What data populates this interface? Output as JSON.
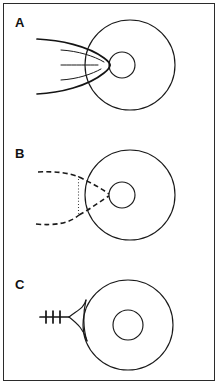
{
  "figure": {
    "width": 218,
    "height": 384,
    "background_color": "#ffffff",
    "border_color": "#2b2b2b",
    "stroke_color": "#1a1a1a"
  },
  "panels": [
    {
      "id": "A",
      "label": "A",
      "label_x": 15,
      "label_y": 27,
      "description": "Solid outer disk circle with smaller inner circle left of center; a solid tapered streamer envelope enters from the left and converges at the inner circle, with three short interior streak lines.",
      "outer_circle": {
        "cx": 130,
        "cy": 65,
        "r": 45,
        "style": "solid"
      },
      "inner_circle": {
        "cx": 122,
        "cy": 65,
        "r": 13,
        "style": "solid"
      },
      "feature": "solid-streamer-envelope",
      "streak_count": 3
    },
    {
      "id": "B",
      "label": "B",
      "label_x": 15,
      "label_y": 158,
      "description": "Solid outer disk circle with smaller inner circle left of center; a dashed tapered envelope enters from the left and converges at the inner circle, crossed by a short vertical dotted line.",
      "outer_circle": {
        "cx": 130,
        "cy": 195,
        "r": 45,
        "style": "solid"
      },
      "inner_circle": {
        "cx": 122,
        "cy": 195,
        "r": 13,
        "style": "solid"
      },
      "feature": "dashed-envelope-with-dotted-chord",
      "dotted_line": {
        "x": 78,
        "y1": 175,
        "y2": 213
      }
    },
    {
      "id": "C",
      "label": "C",
      "label_x": 15,
      "label_y": 289,
      "description": "Solid outer disk circle with concentric inner circle; a narrow concave wedge touches the left edge, fed by a horizontal line bearing three short cross ticks.",
      "outer_circle": {
        "cx": 128,
        "cy": 325,
        "r": 45,
        "style": "solid"
      },
      "inner_circle": {
        "cx": 128,
        "cy": 325,
        "r": 15,
        "style": "solid"
      },
      "feature": "ticked-jet-with-wedge",
      "tick_count": 3,
      "tick_line": {
        "x1": 40,
        "x2": 69,
        "y": 317
      }
    }
  ]
}
